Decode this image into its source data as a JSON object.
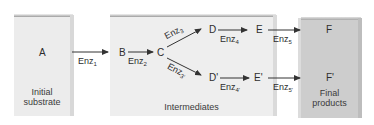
{
  "diagram": {
    "title": "",
    "boxes": {
      "initial": {
        "label": "A",
        "caption_line1": "Initial",
        "caption_line2": "substrate"
      },
      "intermediates": {
        "caption": "Intermediates"
      },
      "final": {
        "label_top": "F",
        "label_bottom": "F'",
        "caption_line1": "Final",
        "caption_line2": "products"
      }
    },
    "nodes": {
      "B": "B",
      "C": "C",
      "D": "D",
      "D_prime": "D'",
      "E": "E",
      "E_prime": "E'"
    },
    "enzymes": [
      {
        "id": "enz1",
        "base": "Enz",
        "sub": "1"
      },
      {
        "id": "enz2",
        "base": "Enz",
        "sub": "2"
      },
      {
        "id": "enz3",
        "base": "Enz",
        "sub": "3"
      },
      {
        "id": "enz3p",
        "base": "Enz",
        "sub": "3'"
      },
      {
        "id": "enz4",
        "base": "Enz",
        "sub": "4"
      },
      {
        "id": "enz4p",
        "base": "Enz",
        "sub": "4'"
      },
      {
        "id": "enz5",
        "base": "Enz",
        "sub": "5"
      },
      {
        "id": "enz5p",
        "base": "Enz",
        "sub": "5'"
      }
    ],
    "colors": {
      "initial_box": "#eaeaea",
      "intermediates_box": "#ececec",
      "final_box": "#cfcfcf",
      "edge": "#9a9a9a",
      "arrow": "#333333"
    }
  }
}
